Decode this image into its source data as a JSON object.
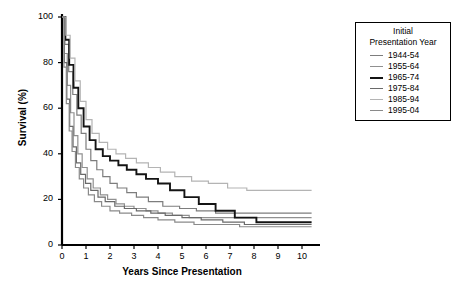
{
  "chart_data": {
    "type": "line",
    "title": "",
    "xlabel": "Years Since Presentation",
    "ylabel": "Survival (%)",
    "xlim": [
      0,
      10.5
    ],
    "ylim": [
      0,
      100
    ],
    "xticks": [
      0,
      1,
      2,
      3,
      4,
      5,
      6,
      7,
      8,
      9,
      10
    ],
    "yticks": [
      0,
      20,
      40,
      60,
      80,
      100
    ],
    "grid": false,
    "legend_position": "right-top",
    "legend_title": "Initial Presentation Year",
    "step": "post",
    "series": [
      {
        "name": "1944-54",
        "color": "#7d7d7d",
        "width": 1.2,
        "x": [
          0,
          0.12,
          0.28,
          0.45,
          0.62,
          0.8,
          1.0,
          1.2,
          1.45,
          1.7,
          2.0,
          2.3,
          2.7,
          3.1,
          3.6,
          4.2,
          4.9,
          5.6,
          6.4,
          7.3,
          8.3,
          9.3,
          10.4
        ],
        "y": [
          100,
          88,
          76,
          66,
          57,
          49,
          42,
          37,
          33,
          30,
          27,
          25,
          23,
          21,
          19,
          17,
          16,
          15,
          14,
          14,
          14,
          14,
          14
        ]
      },
      {
        "name": "1955-64",
        "color": "#909090",
        "width": 1.2,
        "x": [
          0,
          0.1,
          0.22,
          0.36,
          0.5,
          0.66,
          0.84,
          1.05,
          1.3,
          1.6,
          1.9,
          2.25,
          2.6,
          3.0,
          3.5,
          4.0,
          4.6,
          5.3,
          6.1,
          7.0,
          8.0,
          9.0,
          10.4
        ],
        "y": [
          100,
          84,
          70,
          58,
          48,
          40,
          34,
          29,
          25,
          22,
          20,
          18,
          17,
          16,
          15,
          14,
          13,
          12,
          12,
          12,
          12,
          12,
          12
        ]
      },
      {
        "name": "1965-74",
        "color": "#141414",
        "width": 1.9,
        "x": [
          0,
          0.14,
          0.3,
          0.48,
          0.68,
          0.9,
          1.15,
          1.4,
          1.7,
          2.0,
          2.35,
          2.7,
          3.1,
          3.5,
          4.0,
          4.5,
          5.1,
          5.7,
          6.4,
          7.2,
          8.1,
          9.1,
          10.4
        ],
        "y": [
          100,
          90,
          79,
          69,
          60,
          52,
          46,
          42,
          39,
          37,
          35,
          33,
          31,
          29,
          27,
          24,
          21,
          18,
          15,
          12,
          10,
          10,
          10
        ]
      },
      {
        "name": "1975-84",
        "color": "#6a6a6a",
        "width": 1.2,
        "x": [
          0,
          0.1,
          0.2,
          0.32,
          0.46,
          0.6,
          0.78,
          0.98,
          1.2,
          1.5,
          1.8,
          2.2,
          2.6,
          3.1,
          3.7,
          4.3,
          5.0,
          5.8,
          6.7,
          7.6,
          8.6,
          9.6,
          10.4
        ],
        "y": [
          100,
          80,
          64,
          52,
          43,
          36,
          31,
          27,
          24,
          21,
          19,
          17,
          16,
          15,
          14,
          13,
          12,
          11,
          10,
          9,
          9,
          9,
          9
        ]
      },
      {
        "name": "1985-94",
        "color": "#b4b4b4",
        "width": 1.2,
        "x": [
          0,
          0.16,
          0.34,
          0.54,
          0.76,
          1.0,
          1.25,
          1.55,
          1.9,
          2.25,
          2.65,
          3.1,
          3.6,
          4.1,
          4.7,
          5.4,
          6.1,
          6.9,
          7.7,
          8.6,
          9.5,
          10.4
        ],
        "y": [
          100,
          92,
          82,
          72,
          63,
          55,
          49,
          45,
          42,
          40,
          38,
          36,
          34,
          32,
          30,
          28,
          27,
          25,
          24,
          24,
          24,
          24
        ]
      },
      {
        "name": "1995-04",
        "color": "#8a8a8a",
        "width": 1.2,
        "x": [
          0,
          0.08,
          0.18,
          0.3,
          0.42,
          0.56,
          0.72,
          0.9,
          1.1,
          1.35,
          1.65,
          2.0,
          2.4,
          2.9,
          3.4,
          4.0,
          4.7,
          5.5,
          6.4,
          7.4,
          8.5,
          9.5,
          10.4
        ],
        "y": [
          100,
          78,
          62,
          50,
          41,
          34,
          29,
          25,
          22,
          19,
          17,
          15,
          14,
          13,
          12,
          11,
          10,
          9,
          9,
          8,
          8,
          8,
          8
        ]
      }
    ]
  },
  "axes": {
    "ylabel": "Survival (%)",
    "xlabel": "Years Since Presentation",
    "xtick_labels": [
      "0",
      "1",
      "2",
      "3",
      "4",
      "5",
      "6",
      "7",
      "8",
      "9",
      "10"
    ],
    "ytick_labels": [
      "0",
      "20",
      "40",
      "60",
      "80",
      "100"
    ]
  },
  "legend": {
    "title_line1": "Initial",
    "title_line2": "Presentation Year",
    "entries": [
      {
        "label": "1944-54",
        "color": "#7d7d7d"
      },
      {
        "label": "1955-64",
        "color": "#909090"
      },
      {
        "label": "1965-74",
        "color": "#141414"
      },
      {
        "label": "1975-84",
        "color": "#6a6a6a"
      },
      {
        "label": "1985-94",
        "color": "#b4b4b4"
      },
      {
        "label": "1995-04",
        "color": "#8a8a8a"
      }
    ]
  }
}
